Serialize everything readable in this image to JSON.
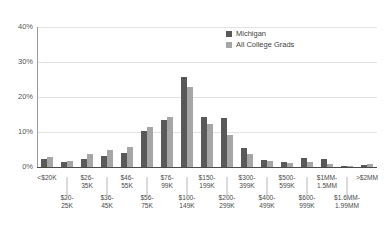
{
  "chart_data": {
    "type": "bar",
    "title": "",
    "xlabel": "",
    "ylabel": "",
    "ylim": [
      0,
      40
    ],
    "yticks": [
      "0%",
      "10%",
      "20%",
      "30%",
      "40%"
    ],
    "ytick_values": [
      0,
      10,
      20,
      30,
      40
    ],
    "grid": true,
    "legend_position": "top-right",
    "categories": [
      "<$20K",
      "$20-25K",
      "$26-35K",
      "$36-45K",
      "$46-55K",
      "$56-75K",
      "$76-99K",
      "$100-149K",
      "$150-199K",
      "$200-299K",
      "$300-399K",
      "$400-499K",
      "$500-599K",
      "$600-999K",
      "$1MM-1.5MM",
      "$1.6MM-1.99MM",
      ">$2MM"
    ],
    "category_labels": [
      {
        "line1": "<$20K",
        "line2": "",
        "row": "top"
      },
      {
        "line1": "$20-",
        "line2": "25K",
        "row": "bot"
      },
      {
        "line1": "$26-",
        "line2": "35K",
        "row": "top"
      },
      {
        "line1": "$36-",
        "line2": "45K",
        "row": "bot"
      },
      {
        "line1": "$46-",
        "line2": "55K",
        "row": "top"
      },
      {
        "line1": "$56-",
        "line2": "75K",
        "row": "bot"
      },
      {
        "line1": "$76-",
        "line2": "99K",
        "row": "top"
      },
      {
        "line1": "$100-",
        "line2": "149K",
        "row": "bot"
      },
      {
        "line1": "$150-",
        "line2": "199K",
        "row": "top"
      },
      {
        "line1": "$200-",
        "line2": "299K",
        "row": "bot"
      },
      {
        "line1": "$300-",
        "line2": "399K",
        "row": "top"
      },
      {
        "line1": "$400-",
        "line2": "499K",
        "row": "bot"
      },
      {
        "line1": "$500-",
        "line2": "599K",
        "row": "top"
      },
      {
        "line1": "$600-",
        "line2": "999K",
        "row": "bot"
      },
      {
        "line1": "$1MM-",
        "line2": "1.5MM",
        "row": "top"
      },
      {
        "line1": "$1.6MM-",
        "line2": "1.99MM",
        "row": "bot"
      },
      {
        "line1": ">$2MM",
        "line2": "",
        "row": "top"
      }
    ],
    "series": [
      {
        "name": "Michigan",
        "color": "#595959",
        "values": [
          2.2,
          1.3,
          2.3,
          3.2,
          4.0,
          10.3,
          13.4,
          25.7,
          14.2,
          14.1,
          5.5,
          2.0,
          1.5,
          2.6,
          2.4,
          0.3,
          0.5
        ]
      },
      {
        "name": "All College Grads",
        "color": "#a6a6a6",
        "values": [
          3.0,
          1.8,
          3.7,
          4.8,
          5.8,
          11.3,
          14.4,
          23.0,
          12.4,
          9.2,
          3.8,
          1.6,
          1.2,
          1.3,
          1.0,
          0.2,
          0.8
        ]
      }
    ]
  },
  "legend": {
    "items": [
      {
        "label": "Michigan"
      },
      {
        "label": "All College Grads"
      }
    ]
  }
}
